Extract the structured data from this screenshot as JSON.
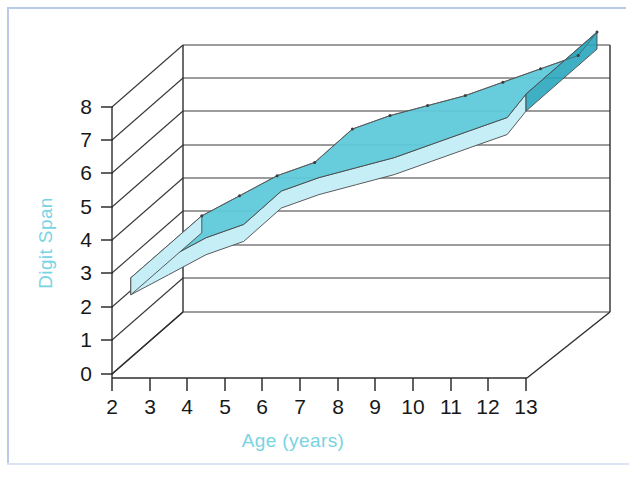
{
  "figure": {
    "name": "digit-span-by-age-3d-ribbon-chart",
    "background_color": "#ffffff",
    "frame_color": "#b9cbe8"
  },
  "chart_data": {
    "type": "area",
    "title": "",
    "subtitle": "",
    "xlabel": "Age (years)",
    "ylabel": "Digit Span",
    "x_tick_labels": [
      "2",
      "3",
      "4",
      "5",
      "6",
      "7",
      "8",
      "9",
      "10",
      "11",
      "12",
      "13"
    ],
    "y_tick_labels": [
      "0",
      "1",
      "2",
      "3",
      "4",
      "5",
      "6",
      "7",
      "8"
    ],
    "xlim": [
      2,
      13
    ],
    "ylim": [
      0,
      8.8
    ],
    "grid": true,
    "legend": null,
    "projection": "3d-ribbon",
    "series": [
      {
        "name": "Digit Span",
        "x": [
          2.5,
          3.5,
          4.5,
          5.5,
          6.5,
          7.5,
          8.5,
          9.5,
          10.5,
          11.5,
          12.5,
          13.0
        ],
        "values": [
          3.0,
          3.6,
          4.2,
          4.6,
          5.6,
          6.0,
          6.3,
          6.6,
          7.0,
          7.4,
          7.8,
          8.5
        ]
      }
    ],
    "colors": {
      "ribbon_top": "#5fc9da",
      "ribbon_top_dark": "#35b4c9",
      "ribbon_front": "#c6eef6",
      "ribbon_end_cap": "#2aa7bd",
      "axis_text": "#17181a",
      "axis_title": "#79d3e2",
      "gridline": "#3a3a3a"
    }
  }
}
